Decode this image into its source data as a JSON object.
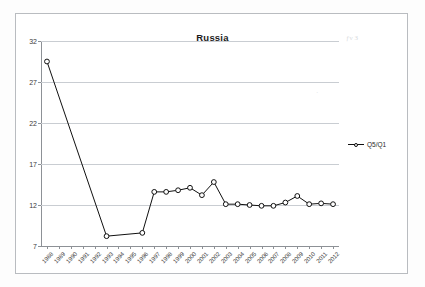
{
  "chart_data": {
    "type": "line",
    "title": "Russia",
    "xlabel": "",
    "ylabel": "",
    "ylim": [
      7,
      32
    ],
    "yticks": [
      7,
      12,
      17,
      22,
      27,
      32
    ],
    "grid": true,
    "legend_position": "right",
    "marker": "open-circle",
    "line_color": "#101010",
    "categories": [
      "1988",
      "1989",
      "1990",
      "1991",
      "1992",
      "1993",
      "1994",
      "1995",
      "1996",
      "1997",
      "1998",
      "1999",
      "2000",
      "2001",
      "2002",
      "2003",
      "2004",
      "2005",
      "2006",
      "2007",
      "2008",
      "2009",
      "2010",
      "2011",
      "2012"
    ],
    "series": [
      {
        "name": "Q5/Q1",
        "values": [
          29.5,
          null,
          null,
          null,
          null,
          8.2,
          null,
          null,
          8.6,
          13.6,
          13.6,
          13.8,
          14.1,
          13.2,
          14.8,
          12.1,
          12.1,
          12.0,
          11.9,
          11.9,
          12.3,
          13.1,
          12.1,
          12.2,
          12.1
        ]
      }
    ],
    "annotations": []
  },
  "legend": {
    "entries": [
      {
        "label": "Q5/Q1"
      }
    ]
  },
  "artifacts": {
    "top_right_smudge": "ƒν З",
    "mid_right_smudge": "·"
  }
}
